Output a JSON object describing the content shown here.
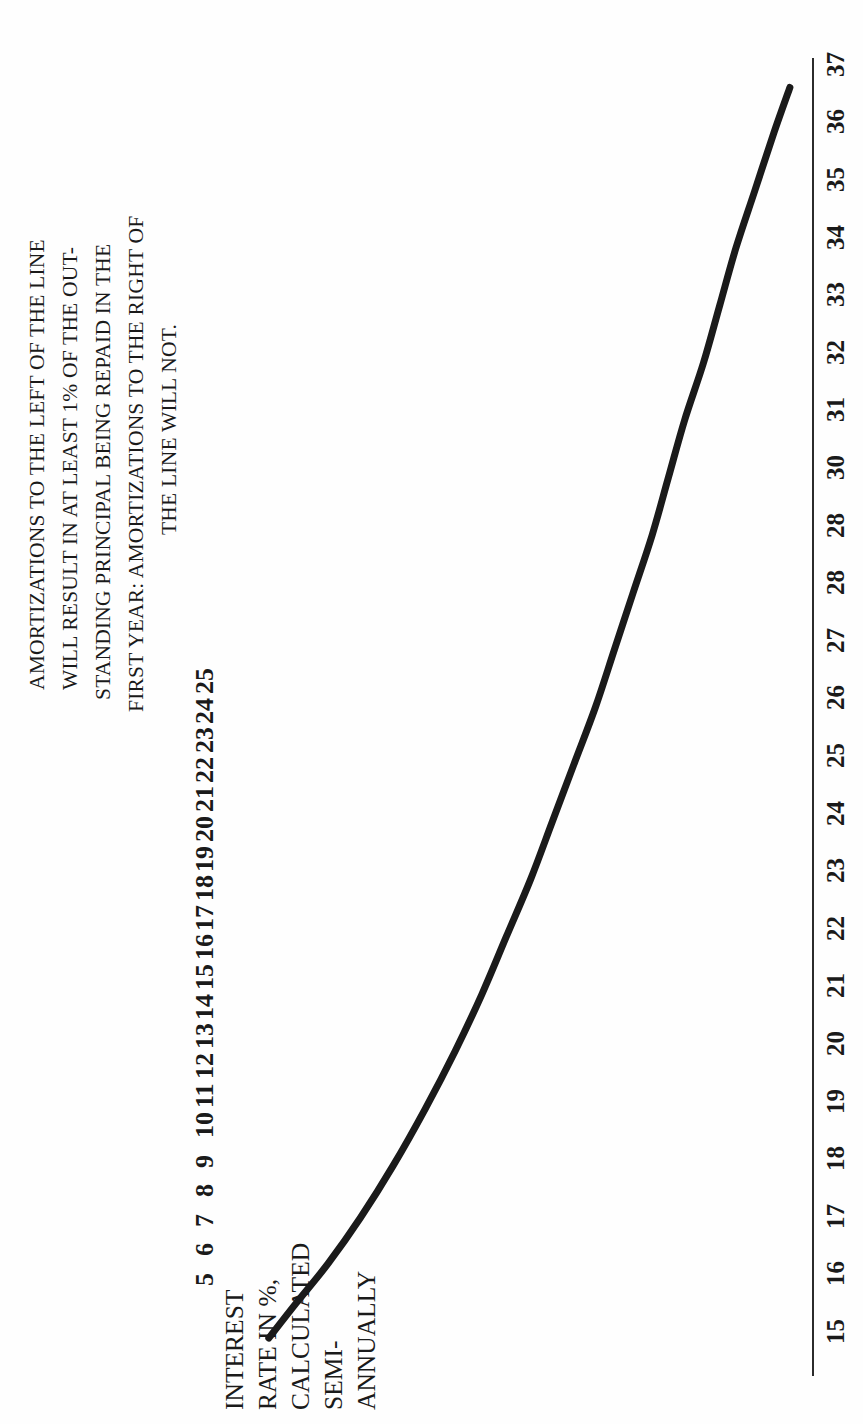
{
  "figure": {
    "note_lines": [
      "AMORTIZATIONS TO THE LEFT OF THE LINE",
      "WILL RESULT IN AT LEAST 1% OF THE OUT-",
      "STANDING PRINCIPAL BEING REPAID IN THE",
      "FIRST YEAR: AMORTIZATIONS TO THE RIGHT OF",
      "THE LINE WILL NOT."
    ],
    "y_axis_title_lines": [
      "INTEREST",
      "RATE IN %,",
      "CALCULATED",
      "SEMI-",
      "ANNUALLY"
    ],
    "ink_color": "#1a1a1a",
    "paper_color": "#fefefe"
  },
  "chart_data": {
    "type": "line",
    "title": "",
    "subtitle": "",
    "xlabel": "AMORTIZATION PERIOD IN YEARS",
    "ylabel": "INTEREST RATE IN %, CALCULATED SEMI-ANNUALLY",
    "orientation": "rotated-90-ccw",
    "grid": false,
    "legend": null,
    "xlim": [
      15,
      37
    ],
    "ylim": [
      5,
      25
    ],
    "xtick_labels": [
      "15",
      "16",
      "17",
      "18",
      "19",
      "20",
      "21",
      "22",
      "23",
      "24",
      "25",
      "26",
      "27",
      "28",
      "28",
      "30",
      "31",
      "32",
      "33",
      "34",
      "35",
      "36",
      "37"
    ],
    "ytick_labels": [
      "25",
      "24",
      "23",
      "22",
      "21",
      "20",
      "19",
      "18",
      "17",
      "16",
      "15",
      "14",
      "13",
      "12",
      "11",
      "10",
      "9",
      "8",
      "7",
      "6",
      "5"
    ],
    "series": [
      {
        "name": "1% principal repayment threshold",
        "x": [
          15.0,
          15.6,
          16.3,
          17.1,
          18.0,
          19.0,
          20.0,
          21.0,
          22.0,
          23.0,
          24.0,
          25.0,
          26.0,
          27.0,
          28.0,
          29.0,
          30.0,
          31.0,
          32.0,
          33.0,
          34.0,
          35.0,
          36.0,
          36.8
        ],
        "y": [
          24.6,
          23.6,
          22.4,
          21.2,
          20.0,
          18.8,
          17.7,
          16.7,
          15.8,
          14.9,
          14.1,
          13.3,
          12.5,
          11.8,
          11.1,
          10.4,
          9.8,
          9.2,
          8.5,
          7.9,
          7.3,
          6.6,
          5.9,
          5.3
        ]
      }
    ]
  }
}
